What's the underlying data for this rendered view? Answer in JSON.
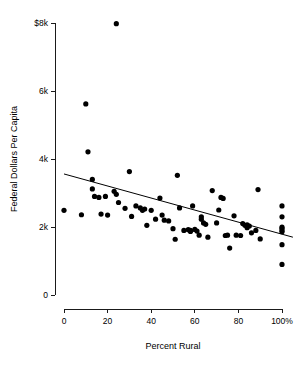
{
  "chart_data": {
    "type": "scatter",
    "title": "",
    "xlabel": "Percent Rural",
    "ylabel": "Federal Dollars Per Capita",
    "xlim": [
      0,
      100
    ],
    "ylim": [
      0,
      8000
    ],
    "grid": false,
    "legend": "none",
    "xticks": [
      {
        "value": 0,
        "label": "0"
      },
      {
        "value": 20,
        "label": "20"
      },
      {
        "value": 40,
        "label": "40"
      },
      {
        "value": 60,
        "label": "60"
      },
      {
        "value": 80,
        "label": "80"
      },
      {
        "value": 100,
        "label": "100%"
      }
    ],
    "yticks": [
      {
        "value": 0,
        "label": "0"
      },
      {
        "value": 2000,
        "label": "2k"
      },
      {
        "value": 4000,
        "label": "4k"
      },
      {
        "value": 6000,
        "label": "6k"
      },
      {
        "value": 8000,
        "label": "$8k"
      }
    ],
    "point_radius": 2.6,
    "trendline": {
      "x0": 0,
      "y0": 3560,
      "x1": 105,
      "y1": 1700,
      "description": "linear-regression-line"
    },
    "points": [
      {
        "x": 0,
        "y": 2490
      },
      {
        "x": 8,
        "y": 2360
      },
      {
        "x": 10,
        "y": 5620
      },
      {
        "x": 11,
        "y": 4210
      },
      {
        "x": 13,
        "y": 3400
      },
      {
        "x": 13,
        "y": 3120
      },
      {
        "x": 14,
        "y": 2900
      },
      {
        "x": 16,
        "y": 2870
      },
      {
        "x": 17,
        "y": 2380
      },
      {
        "x": 19,
        "y": 2900
      },
      {
        "x": 20,
        "y": 2350
      },
      {
        "x": 23,
        "y": 3050
      },
      {
        "x": 24,
        "y": 7980
      },
      {
        "x": 24,
        "y": 2960
      },
      {
        "x": 25,
        "y": 2720
      },
      {
        "x": 28,
        "y": 2550
      },
      {
        "x": 30,
        "y": 3630
      },
      {
        "x": 31,
        "y": 2310
      },
      {
        "x": 33,
        "y": 2620
      },
      {
        "x": 35,
        "y": 2560
      },
      {
        "x": 36,
        "y": 2490
      },
      {
        "x": 37,
        "y": 2530
      },
      {
        "x": 38,
        "y": 2050
      },
      {
        "x": 40,
        "y": 2490
      },
      {
        "x": 42,
        "y": 2230
      },
      {
        "x": 44,
        "y": 2850
      },
      {
        "x": 45,
        "y": 2350
      },
      {
        "x": 46,
        "y": 2200
      },
      {
        "x": 48,
        "y": 2180
      },
      {
        "x": 50,
        "y": 1950
      },
      {
        "x": 51,
        "y": 1640
      },
      {
        "x": 52,
        "y": 3520
      },
      {
        "x": 53,
        "y": 2560
      },
      {
        "x": 55,
        "y": 1900
      },
      {
        "x": 57,
        "y": 1920
      },
      {
        "x": 58,
        "y": 1900
      },
      {
        "x": 58,
        "y": 1870
      },
      {
        "x": 59,
        "y": 2620
      },
      {
        "x": 60,
        "y": 1930
      },
      {
        "x": 61,
        "y": 1880
      },
      {
        "x": 62,
        "y": 1760
      },
      {
        "x": 63,
        "y": 2230
      },
      {
        "x": 63,
        "y": 2300
      },
      {
        "x": 64,
        "y": 2120
      },
      {
        "x": 65,
        "y": 2080
      },
      {
        "x": 66,
        "y": 1700
      },
      {
        "x": 68,
        "y": 3070
      },
      {
        "x": 70,
        "y": 2120
      },
      {
        "x": 71,
        "y": 2500
      },
      {
        "x": 72,
        "y": 2870
      },
      {
        "x": 73,
        "y": 2840
      },
      {
        "x": 74,
        "y": 1750
      },
      {
        "x": 75,
        "y": 1760
      },
      {
        "x": 76,
        "y": 1380
      },
      {
        "x": 78,
        "y": 2330
      },
      {
        "x": 79,
        "y": 1760
      },
      {
        "x": 81,
        "y": 1750
      },
      {
        "x": 82,
        "y": 2100
      },
      {
        "x": 83,
        "y": 2050
      },
      {
        "x": 84,
        "y": 2060
      },
      {
        "x": 84,
        "y": 1980
      },
      {
        "x": 85,
        "y": 2030
      },
      {
        "x": 86,
        "y": 1830
      },
      {
        "x": 88,
        "y": 1900
      },
      {
        "x": 89,
        "y": 3100
      },
      {
        "x": 90,
        "y": 1650
      },
      {
        "x": 100,
        "y": 2620
      },
      {
        "x": 100,
        "y": 2300
      },
      {
        "x": 100,
        "y": 2000
      },
      {
        "x": 100,
        "y": 1960
      },
      {
        "x": 100,
        "y": 1900
      },
      {
        "x": 100,
        "y": 1860
      },
      {
        "x": 100,
        "y": 1480
      },
      {
        "x": 100,
        "y": 900
      }
    ]
  }
}
